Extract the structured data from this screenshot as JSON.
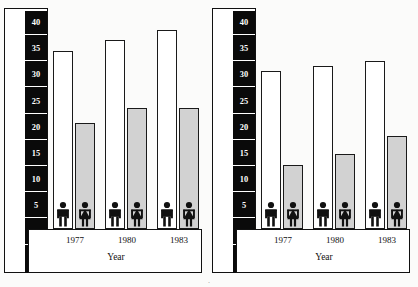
{
  "figure": {
    "panels": [
      {
        "id": "outdoor",
        "ylabel": "Participating in ouodoor activity in previous month",
        "xlabel": "Year",
        "percent_symbol": "%",
        "yticks": [
          "40",
          "35",
          "30",
          "25",
          "20",
          "15",
          "10",
          "5",
          "0"
        ],
        "categories": [
          "1977",
          "1980",
          "1983"
        ],
        "male_values": [
          34,
          36,
          38
        ],
        "female_values": [
          20,
          23,
          23
        ]
      },
      {
        "id": "indoor",
        "ylabel": "Participating in indoor activity in previous month",
        "xlabel": "Year",
        "percent_symbol": "%",
        "yticks": [
          "40",
          "35",
          "30",
          "25",
          "20",
          "15",
          "10",
          "5",
          "0"
        ],
        "categories": [
          "1977",
          "1980",
          "1983"
        ],
        "male_values": [
          30,
          31,
          32
        ],
        "female_values": [
          12,
          14,
          17.5
        ]
      }
    ],
    "colors": {
      "male_bar": "#ffffff",
      "female_bar": "#d2d2d2",
      "axis_strip": "#0a0a0a",
      "ink": "#111111"
    },
    "page_artifact": "."
  },
  "chart_data": [
    {
      "type": "bar",
      "title": "",
      "xlabel": "Year",
      "ylabel": "Participating in ouodoor activity in previous month",
      "ylim": [
        0,
        42
      ],
      "yticks": [
        0,
        5,
        10,
        15,
        20,
        25,
        30,
        35,
        40
      ],
      "unit": "%",
      "grid": false,
      "legend": "none",
      "categories": [
        "1977",
        "1980",
        "1983"
      ],
      "series": [
        {
          "name": "Male",
          "values": [
            34,
            36,
            38
          ]
        },
        {
          "name": "Female",
          "values": [
            20,
            23,
            23
          ]
        }
      ]
    },
    {
      "type": "bar",
      "title": "",
      "xlabel": "Year",
      "ylabel": "Participating in indoor activity in previous month",
      "ylim": [
        0,
        42
      ],
      "yticks": [
        0,
        5,
        10,
        15,
        20,
        25,
        30,
        35,
        40
      ],
      "unit": "%",
      "grid": false,
      "legend": "none",
      "categories": [
        "1977",
        "1980",
        "1983"
      ],
      "series": [
        {
          "name": "Male",
          "values": [
            30,
            31,
            32
          ]
        },
        {
          "name": "Female",
          "values": [
            12,
            14,
            17.5
          ]
        }
      ]
    }
  ]
}
